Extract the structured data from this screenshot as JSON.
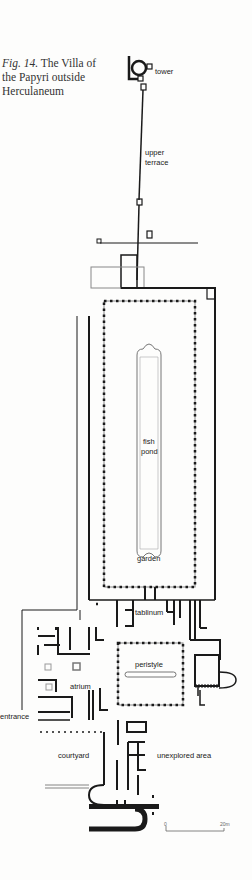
{
  "caption": {
    "fig_label": "Fig. 14.",
    "title": "The Villa of the Papyri outside Herculaneum"
  },
  "labels": {
    "tower": "tower",
    "upper_terrace_1": "upper",
    "upper_terrace_2": "terrace",
    "fish_pond_1": "fish",
    "fish_pond_2": "pond",
    "garden": "garden",
    "tablinum": "tablinum",
    "peristyle": "peristyle",
    "atrium": "atrium",
    "entrance": "entrance",
    "courtyard": "courtyard",
    "unexplored_area": "unexplored area"
  },
  "scale_bar": {
    "start": "0",
    "end": "20m"
  },
  "colors": {
    "ink": "#1a1a1a",
    "paper": "#fdfdfc",
    "grey_line": "#888888"
  }
}
